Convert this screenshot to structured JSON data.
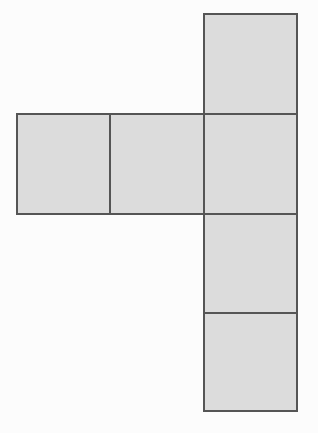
{
  "figure": {
    "kind": "geometric-diagram",
    "shape_name": "hexomino",
    "square_count": 6,
    "unit_square_width": 93,
    "unit_square_height": 100,
    "canvas_width": 318,
    "canvas_height": 433
  },
  "colors": {
    "background": "#fcfcfc",
    "square_fill": "#dcdcdc",
    "square_stroke": "#555555",
    "stroke_width": 2
  },
  "chart_data": {
    "type": "diagram",
    "title": "",
    "xlabel": "",
    "ylabel": "",
    "grid": false,
    "legend": null,
    "annotations": [],
    "tick_labels": [],
    "squares": [
      {
        "id": "square-top",
        "label": "",
        "position": "column-row-1",
        "x": 204,
        "y": 14,
        "width": 93,
        "height": 100
      },
      {
        "id": "square-left",
        "label": "",
        "position": "row-col-1",
        "x": 17,
        "y": 114,
        "width": 93,
        "height": 100
      },
      {
        "id": "square-middle",
        "label": "",
        "position": "row-col-2",
        "x": 110,
        "y": 114,
        "width": 94,
        "height": 100
      },
      {
        "id": "square-center",
        "label": "",
        "position": "row-col-3-and-column-row-2",
        "x": 204,
        "y": 114,
        "width": 93,
        "height": 100
      },
      {
        "id": "square-lower",
        "label": "",
        "position": "column-row-3",
        "x": 204,
        "y": 214,
        "width": 93,
        "height": 99
      },
      {
        "id": "square-bottom",
        "label": "",
        "position": "column-row-4",
        "x": 204,
        "y": 313,
        "width": 93,
        "height": 98
      }
    ]
  }
}
